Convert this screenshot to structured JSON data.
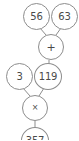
{
  "diagram": {
    "type": "arithmetic-expression-tree",
    "background_color": "#ffffff",
    "stroke_color": "#8d8d8d",
    "text_color": "#4a4a4a",
    "nodes": [
      {
        "id": "a",
        "label": "56",
        "kind": "operand",
        "row": 1
      },
      {
        "id": "b",
        "label": "63",
        "kind": "operand",
        "row": 1
      },
      {
        "id": "plus",
        "label": "+",
        "kind": "operator",
        "row": 2
      },
      {
        "id": "c",
        "label": "3",
        "kind": "operand",
        "row": 3
      },
      {
        "id": "d",
        "label": "119",
        "kind": "operand",
        "row": 3
      },
      {
        "id": "times",
        "label": "×",
        "kind": "operator",
        "row": 4
      },
      {
        "id": "result",
        "label": "357",
        "kind": "operand",
        "row": 5
      }
    ],
    "edges": [
      {
        "from": "a",
        "to": "plus"
      },
      {
        "from": "b",
        "to": "plus"
      },
      {
        "from": "plus",
        "to": "d"
      },
      {
        "from": "c",
        "to": "times"
      },
      {
        "from": "d",
        "to": "times"
      },
      {
        "from": "times",
        "to": "result"
      }
    ]
  }
}
